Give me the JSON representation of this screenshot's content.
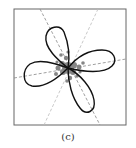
{
  "figure": {
    "caption": "(c)",
    "frame": {
      "x": 14,
      "y": 9,
      "width": 112,
      "height": 116,
      "stroke": "#666666"
    },
    "colors": {
      "curve": "#111111",
      "axis_dark": "#888888",
      "axis_light": "#bbbbbb",
      "points": "#7a7a7a"
    },
    "center": {
      "x": 68,
      "y": 68
    },
    "axes": [
      {
        "name": "principal-axis-1",
        "x1": 40,
        "y1": 9,
        "x2": 100,
        "y2": 125,
        "tone": "dark"
      },
      {
        "name": "principal-axis-2",
        "x1": 14,
        "y1": 78,
        "x2": 126,
        "y2": 59,
        "tone": "dark"
      },
      {
        "name": "principal-axis-3",
        "x1": 98,
        "y1": 9,
        "x2": 44,
        "y2": 125,
        "tone": "light"
      }
    ],
    "petals": [
      {
        "name": "petal-upper-left",
        "tip": {
          "x": 54,
          "y": 28
        }
      },
      {
        "name": "petal-right",
        "tip": {
          "x": 115,
          "y": 60
        }
      },
      {
        "name": "petal-lower",
        "tip": {
          "x": 88,
          "y": 112
        }
      },
      {
        "name": "petal-left",
        "tip": {
          "x": 26,
          "y": 74
        }
      }
    ]
  }
}
